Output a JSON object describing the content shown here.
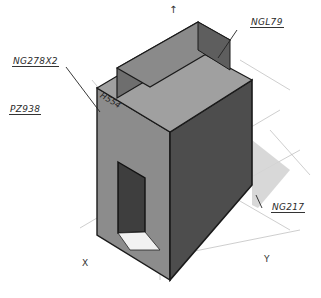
{
  "diagram": {
    "type": "isometric architectural sketch",
    "labels": {
      "top_left": "NG278X2",
      "left_middle": "PZ938",
      "top_right": "NGL79",
      "bottom_right": "NG217",
      "face_mark": "H554"
    },
    "axes": {
      "x": "X",
      "y": "Y",
      "z_arrow": "↑"
    },
    "colors": {
      "background": "#ffffff",
      "top_face": "#9c9c9c",
      "left_face": "#8a8a8a",
      "right_face": "#4a4a4a",
      "upper_block_top": "#8f8f8f",
      "upper_block_front": "#6a6a6a",
      "door": "#3c3c3c",
      "shadow": "#d2d2d2",
      "stroke": "#1a1a1a"
    }
  }
}
